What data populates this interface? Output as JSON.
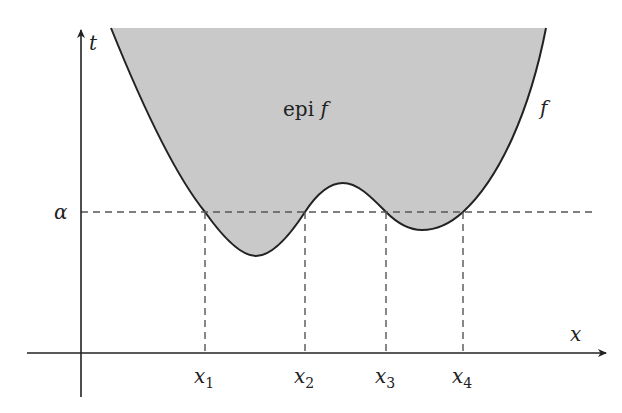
{
  "figure": {
    "type": "epigraph-diagram",
    "colors": {
      "region_fill": "#c9c9c9",
      "curve": "#222222",
      "axes": "#222222",
      "dashes": "#555555",
      "background": "#ffffff"
    },
    "labels": {
      "y_axis": "t",
      "x_axis": "x",
      "function": "f",
      "region_prefix": "epi ",
      "region_suffix": "f",
      "level": "α",
      "x1": "x",
      "x1_sub": "1",
      "x2": "x",
      "x2_sub": "2",
      "x3": "x",
      "x3_sub": "3",
      "x4": "x",
      "x4_sub": "4"
    },
    "axes": {
      "y_axis_x": 81,
      "x_axis_y": 353,
      "y_top": 28,
      "y_bottom": 397,
      "x_left": 27,
      "x_right": 608
    },
    "level_line": {
      "y": 212,
      "x_start": 81,
      "x_end": 592
    },
    "crossings_px": [
      205,
      305,
      386,
      463
    ],
    "extrema_px": {
      "global_min": [
        256,
        256
      ],
      "local_max": [
        343,
        183
      ],
      "local_min": [
        422,
        230
      ]
    }
  }
}
